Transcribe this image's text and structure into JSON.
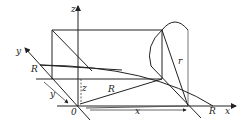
{
  "diagram": {
    "labels": {
      "z_axis": "z",
      "y_axis": "y",
      "x_axis": "x",
      "origin": "0",
      "R_left": "R",
      "y_dim": "y",
      "z_dim": "z",
      "R_mid": "R",
      "x_dim": "x",
      "R_right": "R",
      "r": "r"
    },
    "colors": {
      "stroke": "#222222",
      "background": "#ffffff"
    }
  }
}
